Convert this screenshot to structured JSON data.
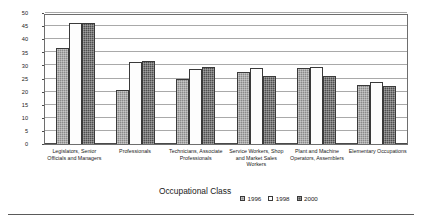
{
  "chart_data": {
    "type": "bar",
    "title": "",
    "xlabel": "Occupational Class",
    "ylabel": "Gap between Average Male Wage and Average Female Wage (%)",
    "ylabel_line1": "Gap between Average Male Wage",
    "ylabel_line2": "and Average Female Wage (%)",
    "ylim": [
      0,
      50
    ],
    "ytick_step": 5,
    "yticks": [
      0,
      5,
      10,
      15,
      20,
      25,
      30,
      35,
      40,
      45,
      50
    ],
    "grid": true,
    "legend_position": "bottom-right",
    "categories": [
      "Legislators, Senior Officials and Managers",
      "Professionals",
      "Technicians, Associate Professionals",
      "Service Workers, Shop and Market Sales Workers",
      "Plant and Machine Operators, Assemblers",
      "Elementary Occupations"
    ],
    "category_lines": [
      [
        "Legislators, Senior",
        "Officials and Managers"
      ],
      [
        "Professionals"
      ],
      [
        "Technicians, Associate",
        "Professionals"
      ],
      [
        "Service Workers, Shop",
        "and Market Sales Workers"
      ],
      [
        "Plant and Machine",
        "Operators, Assemblers"
      ],
      [
        "Elementary Occupations"
      ]
    ],
    "series": [
      {
        "name": "1996",
        "color": "#8a8a8a",
        "values": [
          36.5,
          20.7,
          24.8,
          27.5,
          29.0,
          22.5
        ]
      },
      {
        "name": "1998",
        "color": "#fdfdfd",
        "values": [
          46.0,
          31.2,
          28.5,
          29.0,
          29.5,
          23.5
        ]
      },
      {
        "name": "2000",
        "color": "#4f4f4f",
        "values": [
          46.0,
          31.5,
          29.5,
          25.8,
          25.8,
          22.0
        ]
      }
    ]
  },
  "legend": {
    "items": [
      {
        "label": "1996"
      },
      {
        "label": "1998"
      },
      {
        "label": "2000"
      }
    ]
  }
}
